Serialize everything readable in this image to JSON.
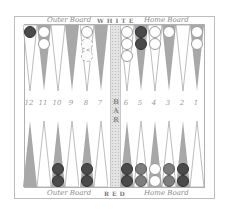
{
  "board": {
    "top_labels": {
      "left": "Outer Board",
      "center": "WHITE",
      "right": "Home Board"
    },
    "bottom_labels": {
      "left": "Outer Board",
      "center": "RED",
      "right": "Home Board"
    },
    "bar_label": "BAR",
    "colors": {
      "shaded_point": "#a8a8a8",
      "light_point": "#ffffff",
      "dark_checker": "#4a4a4a",
      "medium_checker": "#7d7d7d",
      "white_checker": "#ffffff",
      "bar": "#e3e3e3"
    }
  },
  "point_numbers": {
    "left": [
      "12",
      "11",
      "10",
      "9",
      "8",
      "7"
    ],
    "right": [
      "6",
      "5",
      "4",
      "3",
      "2",
      "1"
    ]
  },
  "top_points": [
    {
      "x": 30,
      "shaded": false,
      "checkers": [
        "dark"
      ]
    },
    {
      "x": 44,
      "shaded": true,
      "checkers": [
        "white",
        "white"
      ]
    },
    {
      "x": 58,
      "shaded": false,
      "checkers": []
    },
    {
      "x": 72,
      "shaded": true,
      "checkers": []
    },
    {
      "x": 87,
      "shaded": false,
      "checkers": [
        "white",
        "faded",
        "faded"
      ]
    },
    {
      "x": 101,
      "shaded": true,
      "checkers": []
    },
    {
      "x": 127,
      "shaded": false,
      "checkers": [
        "white",
        "white",
        "white"
      ]
    },
    {
      "x": 141,
      "shaded": true,
      "checkers": [
        "dark",
        "dark"
      ]
    },
    {
      "x": 155,
      "shaded": false,
      "checkers": [
        "white",
        "white"
      ]
    },
    {
      "x": 169,
      "shaded": true,
      "checkers": [
        "white"
      ]
    },
    {
      "x": 183,
      "shaded": false,
      "checkers": []
    },
    {
      "x": 197,
      "shaded": true,
      "checkers": [
        "white",
        "white"
      ]
    }
  ],
  "bottom_points": [
    {
      "x": 30,
      "shaded": true,
      "checkers": []
    },
    {
      "x": 44,
      "shaded": false,
      "checkers": []
    },
    {
      "x": 58,
      "shaded": true,
      "checkers": [
        "dark",
        "dark"
      ]
    },
    {
      "x": 72,
      "shaded": false,
      "checkers": []
    },
    {
      "x": 87,
      "shaded": true,
      "checkers": [
        "dark",
        "dark"
      ]
    },
    {
      "x": 101,
      "shaded": false,
      "checkers": []
    },
    {
      "x": 127,
      "shaded": true,
      "checkers": [
        "dark",
        "dark"
      ]
    },
    {
      "x": 141,
      "shaded": false,
      "checkers": [
        "medium",
        "medium"
      ]
    },
    {
      "x": 155,
      "shaded": true,
      "checkers": [
        "white",
        "white"
      ]
    },
    {
      "x": 169,
      "shaded": false,
      "checkers": [
        "medium",
        "medium"
      ]
    },
    {
      "x": 183,
      "shaded": true,
      "checkers": [
        "dark",
        "dark"
      ]
    },
    {
      "x": 197,
      "shaded": false,
      "checkers": []
    }
  ]
}
